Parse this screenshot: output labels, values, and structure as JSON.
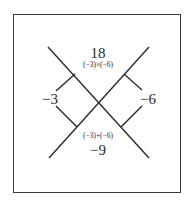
{
  "diagram": {
    "type": "x-factor-diamond",
    "top_value": "18",
    "top_expression": "(−3)×(−6)",
    "left_value": "−3",
    "right_value": "−6",
    "bottom_expression": "(−3)+(−6)",
    "bottom_value": "−9"
  },
  "colors": {
    "line": "#2a2a2a",
    "border": "#3a3a3a",
    "text": "#2a2a2a",
    "background": "#ffffff"
  }
}
